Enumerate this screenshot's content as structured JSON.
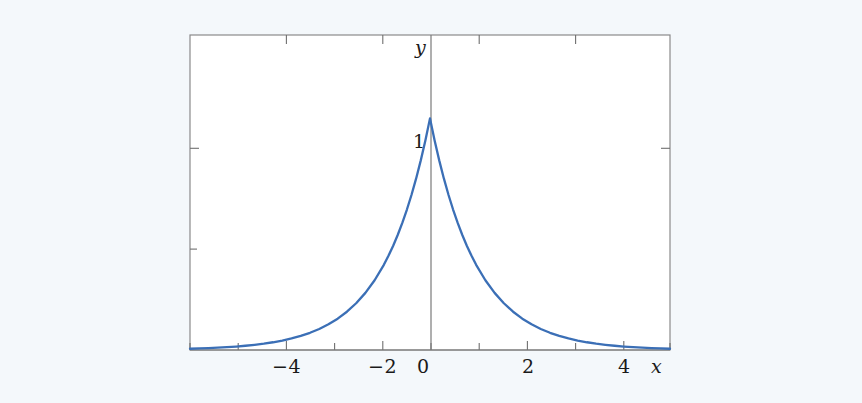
{
  "figure": {
    "background_color": "#f4f8fb",
    "plot_background_color": "#ffffff",
    "frame_color": "#808080",
    "axis_color": "#7a7a7a",
    "curve_color": "#3b6fb6",
    "text_color": "#1a1a1a"
  },
  "chart_data": {
    "type": "line",
    "title": "",
    "subtitle": "",
    "xlabel": "x",
    "ylabel": "y",
    "xlim": [
      -5.2,
      5.2
    ],
    "ylim": [
      0,
      1.36
    ],
    "grid": false,
    "legend": null,
    "function": "y = e^(-|x|)",
    "xticks": [
      -4,
      -2,
      0,
      2,
      4
    ],
    "xtick_labels": [
      "−4",
      "−2",
      "0",
      "2",
      "4"
    ],
    "xminor_ticks": [
      -5,
      -3,
      -1,
      1,
      3,
      5
    ],
    "yticks": [
      0.5,
      1
    ],
    "ytick_labels": [
      "",
      "1"
    ],
    "annotations": [
      {
        "text": "1",
        "x": 0,
        "y": 1
      }
    ],
    "series": [
      {
        "name": "e^(-|x|)",
        "color": "#3b6fb6",
        "x": [
          -5.2,
          -5.0,
          -4.8,
          -4.6,
          -4.4,
          -4.2,
          -4.0,
          -3.8,
          -3.6,
          -3.4,
          -3.2,
          -3.0,
          -2.8,
          -2.6,
          -2.4,
          -2.2,
          -2.0,
          -1.8,
          -1.6,
          -1.4,
          -1.2,
          -1.0,
          -0.9,
          -0.8,
          -0.7,
          -0.6,
          -0.5,
          -0.4,
          -0.3,
          -0.2,
          -0.1,
          0.0,
          0.1,
          0.2,
          0.3,
          0.4,
          0.5,
          0.6,
          0.7,
          0.8,
          0.9,
          1.0,
          1.2,
          1.4,
          1.6,
          1.8,
          2.0,
          2.2,
          2.4,
          2.6,
          2.8,
          3.0,
          3.2,
          3.4,
          3.6,
          3.8,
          4.0,
          4.2,
          4.4,
          4.6,
          4.8,
          5.0,
          5.2
        ],
        "y": [
          0.0055,
          0.0067,
          0.0082,
          0.0101,
          0.0123,
          0.015,
          0.0183,
          0.0224,
          0.0273,
          0.0334,
          0.0408,
          0.0498,
          0.0608,
          0.0743,
          0.0907,
          0.1108,
          0.1353,
          0.1653,
          0.2019,
          0.2466,
          0.3012,
          0.3679,
          0.4066,
          0.4493,
          0.4966,
          0.5488,
          0.6065,
          0.6703,
          0.7408,
          0.8187,
          0.9048,
          1.0,
          0.9048,
          0.8187,
          0.7408,
          0.6703,
          0.6065,
          0.5488,
          0.4966,
          0.4493,
          0.4066,
          0.3679,
          0.3012,
          0.2466,
          0.2019,
          0.1653,
          0.1353,
          0.1108,
          0.0907,
          0.0743,
          0.0608,
          0.0498,
          0.0408,
          0.0334,
          0.0273,
          0.0224,
          0.0183,
          0.015,
          0.0123,
          0.0101,
          0.0082,
          0.0067,
          0.0055
        ]
      }
    ]
  },
  "labels": {
    "x_axis_name": "x",
    "y_axis_name": "y",
    "xtick_m4": "−4",
    "xtick_m2": "−2",
    "xtick_0": "0",
    "xtick_2": "2",
    "xtick_4": "4",
    "ytick_1": "1"
  }
}
